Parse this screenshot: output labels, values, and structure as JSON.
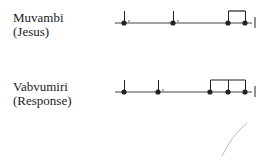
{
  "rows": [
    {
      "name": "Muvambi",
      "gloss": "(Jesus)",
      "staff_y": 23,
      "line_x": [
        115,
        252
      ],
      "end_bar_x": 255,
      "notes": [
        {
          "x": 124,
          "dotted": true,
          "stem": true
        },
        {
          "x": 173,
          "dotted": true,
          "stem": true
        },
        {
          "x": 228,
          "dotted": false,
          "stem": true
        },
        {
          "x": 245,
          "dotted": false,
          "stem": true
        }
      ],
      "beams": [
        [
          228,
          245
        ]
      ]
    },
    {
      "name": "Vabvumiri",
      "gloss": "(Response)",
      "staff_y": 92,
      "line_x": [
        115,
        252
      ],
      "end_bar_x": 255,
      "notes": [
        {
          "x": 124,
          "dotted": false,
          "stem": true
        },
        {
          "x": 158,
          "dotted": true,
          "stem": true
        },
        {
          "x": 210,
          "dotted": false,
          "stem": true
        },
        {
          "x": 228,
          "dotted": false,
          "stem": true
        },
        {
          "x": 245,
          "dotted": false,
          "stem": true
        }
      ],
      "beams": [
        [
          210,
          245
        ]
      ]
    }
  ],
  "colors": {
    "ink": "#222222",
    "line": "#444444"
  }
}
